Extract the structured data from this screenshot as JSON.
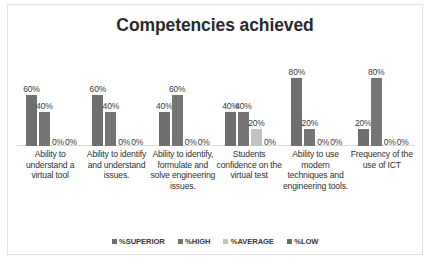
{
  "chart_data": {
    "type": "bar",
    "title": "Competencies achieved",
    "xlabel": "",
    "ylabel": "",
    "ylim": [
      0,
      100
    ],
    "grid": false,
    "legend_position": "bottom",
    "value_suffix": "%",
    "categories": [
      "Ability to understand a virtual tool",
      "Ability to identify and understand issues.",
      "Ability to identify, formulate and solve engineering issues.",
      "Students confidence on the virtual test",
      "Ability to use modern techniques and engineering tools.",
      "Frequency of the use of ICT"
    ],
    "series": [
      {
        "name": "%SUPERIOR",
        "color": "#6f6f6f",
        "values": [
          60,
          60,
          40,
          40,
          80,
          20
        ]
      },
      {
        "name": "%HIGH",
        "color": "#757575",
        "values": [
          40,
          40,
          60,
          40,
          20,
          80
        ]
      },
      {
        "name": "%AVERAGE",
        "color": "#c2c2c2",
        "values": [
          0,
          0,
          0,
          20,
          0,
          0
        ]
      },
      {
        "name": "%LOW",
        "color": "#6b6b6b",
        "values": [
          0,
          0,
          0,
          0,
          0,
          0
        ]
      }
    ],
    "data_labels": [
      [
        "60%",
        "40%",
        "0%",
        "0%"
      ],
      [
        "60%",
        "40%",
        "0%",
        "0%"
      ],
      [
        "40%",
        "60%",
        "0%",
        "0%"
      ],
      [
        "40%",
        "40%",
        "20%",
        "0%"
      ],
      [
        "80%",
        "20%",
        "0%",
        "0%"
      ],
      [
        "20%",
        "80%",
        "0%",
        "0%"
      ]
    ]
  },
  "legend": {
    "items": [
      {
        "label": "%SUPERIOR"
      },
      {
        "label": "%HIGH"
      },
      {
        "label": "%AVERAGE"
      },
      {
        "label": "%LOW"
      }
    ]
  },
  "artifact": {
    "text": ""
  }
}
